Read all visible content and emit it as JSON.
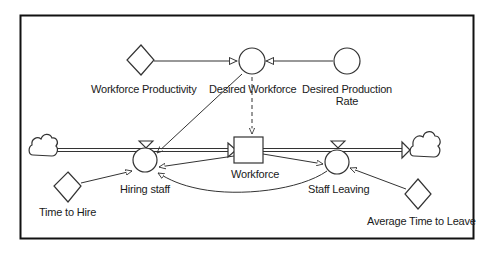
{
  "diagram": {
    "type": "stock-and-flow",
    "stock": {
      "label": "Workforce"
    },
    "flows": [
      {
        "id": "hiring",
        "label": "Hiring staff"
      },
      {
        "id": "leaving",
        "label": "Staff Leaving"
      }
    ],
    "auxiliaries": [
      {
        "id": "desired_workforce",
        "label": "Desired Workforce"
      },
      {
        "id": "desired_production_rate",
        "label": "Desired Production Rate",
        "line1": "Desired Production",
        "line2": "Rate"
      }
    ],
    "constants": [
      {
        "id": "workforce_productivity",
        "label": "Workforce Productivity"
      },
      {
        "id": "time_to_hire",
        "label": "Time to Hire"
      },
      {
        "id": "average_time_to_leave",
        "label": "Average Time to Leave"
      }
    ],
    "clouds": [
      "source-cloud",
      "sink-cloud"
    ],
    "colors": {
      "stroke": "#333333",
      "background": "#ffffff",
      "frame": "#111111"
    }
  }
}
